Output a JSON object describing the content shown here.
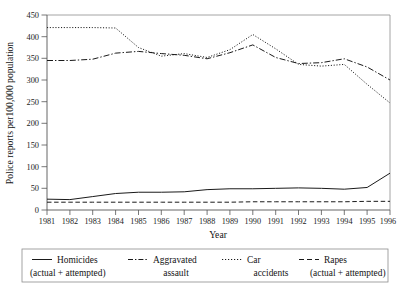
{
  "chart_data": {
    "type": "line",
    "title": "",
    "xlabel": "Year",
    "ylabel": "Police reports per100,000 population",
    "x": [
      1981,
      1982,
      1983,
      1984,
      1985,
      1986,
      1987,
      1988,
      1989,
      1990,
      1991,
      1992,
      1993,
      1994,
      1995,
      1996
    ],
    "xtick_labels": [
      "1981",
      "1982",
      "1983",
      "1984",
      "1985",
      "1986",
      "1987",
      "1988",
      "1989",
      "1990",
      "1991",
      "1992",
      "1993",
      "1994",
      "1995",
      "1996"
    ],
    "ytick_labels": [
      "0",
      "50",
      "100",
      "150",
      "200",
      "250",
      "300",
      "350",
      "400",
      "450"
    ],
    "ytick_values": [
      0,
      50,
      100,
      150,
      200,
      250,
      300,
      350,
      400,
      450
    ],
    "xlim": [
      1981,
      1996
    ],
    "ylim": [
      0,
      450
    ],
    "grid": false,
    "legend_position": "below-axes",
    "series": [
      {
        "name": "Homicides (actual + attempted)",
        "style": "solid",
        "values": [
          25,
          24,
          31,
          38,
          41,
          41,
          42,
          47,
          49,
          49,
          50,
          51,
          50,
          48,
          52,
          85
        ]
      },
      {
        "name": "Aggravated assault",
        "style": "dash-dot",
        "values": [
          345,
          345,
          348,
          362,
          366,
          361,
          357,
          349,
          363,
          381,
          352,
          338,
          340,
          349,
          355,
          352
        ]
      },
      {
        "name": "Car accidents",
        "style": "dotted",
        "values": [
          421,
          421,
          421,
          420,
          375,
          355,
          361,
          352,
          370,
          405,
          372,
          336,
          332,
          336,
          341,
          338
        ]
      },
      {
        "name": "Rapes (actual + attempted)",
        "style": "dashed",
        "values": [
          18,
          18,
          18,
          18,
          18,
          18,
          18,
          18,
          18,
          19,
          19,
          19,
          19,
          19,
          20,
          20
        ]
      }
    ],
    "series_tail": {
      "aggravated_assault_end": [
        1994,
        349,
        1995,
        330,
        1996,
        300
      ],
      "car_accidents_end": [
        1994,
        336,
        1995,
        290,
        1996,
        247
      ]
    }
  },
  "legend": {
    "entries": [
      {
        "swatch": "solid-line",
        "line1": "Homicides",
        "line2": "(actual + attempted)"
      },
      {
        "swatch": "dash-dot-line",
        "line1": "Aggravated",
        "line2": "assault"
      },
      {
        "swatch": "dotted-line",
        "line1": "Car",
        "line2": "accidents"
      },
      {
        "swatch": "dashed-line",
        "line1": "Rapes",
        "line2": "(actual + attempted)"
      }
    ]
  },
  "axes": {
    "y_title": "Police reports per100,000 population",
    "x_title": "Year",
    "y_ticks": [
      "450",
      "400",
      "350",
      "300",
      "250",
      "200",
      "150",
      "100",
      "50",
      "0"
    ],
    "x_ticks": [
      "1981",
      "1982",
      "1983",
      "1984",
      "1985",
      "1986",
      "1987",
      "1988",
      "1989",
      "1990",
      "1991",
      "1992",
      "1993",
      "1994",
      "1995",
      "1996"
    ]
  },
  "colors": {
    "ink": "#1a1a1a",
    "axis": "#555555",
    "frame": "#8d8d8d",
    "background": "#ffffff"
  }
}
